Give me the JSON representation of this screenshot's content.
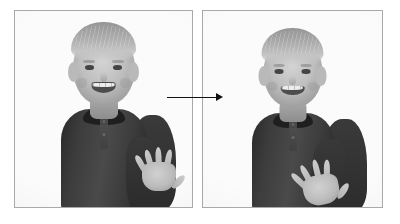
{
  "figure": {
    "title": "",
    "type": "before-after photo sequence",
    "background_color": "#ffffff",
    "panel_border_color": "#a9a9a9",
    "colorspace": "grayscale"
  },
  "panels": [
    {
      "id": "before",
      "position": "left",
      "alt": "Grayscale photo of a smiling young blond boy in a dark henley shirt holding both open hands, palms forward with fingers spread, up near his chest",
      "subject": {
        "hair_color": "#c4ae8b",
        "skin_color": "#cdbca7",
        "shirt_color": "#3d3d3d",
        "expression": "smiling",
        "hand_pose": "both palms open, fingers spread, held high near chest",
        "hand_separation": "narrow"
      }
    },
    {
      "id": "after",
      "position": "right",
      "alt": "Grayscale photo of the same smiling boy with both open hands moved outward and downward, palms forward with fingers spread, arms extended to the sides",
      "subject": {
        "hair_color": "#c4ae8b",
        "skin_color": "#cdbca7",
        "shirt_color": "#3d3d3d",
        "expression": "smiling",
        "hand_pose": "both palms open, fingers spread, moved outward and lowered",
        "hand_separation": "wide"
      }
    }
  ],
  "arrow": {
    "label": "",
    "direction": "right",
    "color": "#111111",
    "from_panel": "before",
    "to_panel": "after"
  }
}
